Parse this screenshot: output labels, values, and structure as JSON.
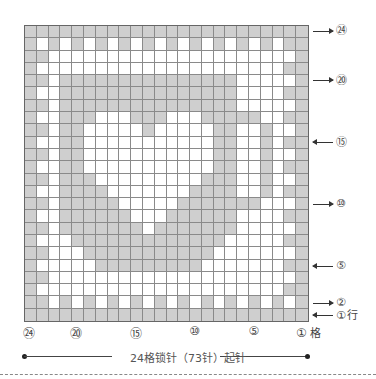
{
  "chart": {
    "columns": 24,
    "rows": 24,
    "legend": {
      "g": "shaded cell",
      "w": "open cell"
    },
    "pattern_top_to_bottom": [
      "GGGGGGGGGGGGGGGGGGGGGGGG",
      "GWGWGWGWGWGWGWGWGWGWGWGG",
      "GGWWWWWWWWWWWWWWWWWWWWWG",
      "GWWWWWWWWWWWWWWWWWWWWWGG",
      "GGWGGGGGGGGGGGGGGGWWWWWG",
      "GWWGGGGGGGGGGGGGGGWWWWGG",
      "GGWGGGGGGGGGGGGGGGWWWWWG",
      "GWWGGGWWWGGGWWWGGGGGWWGG",
      "GGWGGWWWWWGWWWWWGGWWGWWG",
      "GWWGGWWWWWWWWWWWGGWWGWGG",
      "GGWGGWWWWWWWWWWWGGWWGWWG",
      "GWWGGWWWWWWWWWWWGGWWGWGG",
      "GGWGGGWWWWWWWWWGGGWWGWWG",
      "GWWGGGGWWWWWWWGGGGWWGWGG",
      "GGWGGGGGWWWWWGGGGGGGWWWG",
      "GWWGGGGGGWWWGGGGGGWWWWGG",
      "GGWGGGGGGGWGGGGGGGWWWWWG",
      "GWWWGGGGGGGGGGGGGWWWWWGG",
      "GGWWWGGGGGGGGGGGWWWWWWWG",
      "GWWWWWGGGGGGGGGWWWWWWWGG",
      "GGWWWWWWWWWWWWWWWWWWWWWG",
      "GWWWWWWWWWWWWWWWWWWWWWGG",
      "GGWGWGWGWGWGWGWGWGWGWGWG",
      "GGGGGGGGGGGGGGGGGGGGGGGG"
    ]
  },
  "row_labels": [
    {
      "text": "㉔",
      "dir": "right",
      "row": 24
    },
    {
      "text": "⑳",
      "dir": "right",
      "row": 20
    },
    {
      "text": "⑮",
      "dir": "left",
      "row": 15
    },
    {
      "text": "⑩",
      "dir": "right",
      "row": 10
    },
    {
      "text": "⑤",
      "dir": "left",
      "row": 5
    },
    {
      "text": "②",
      "dir": "right",
      "row": 2
    },
    {
      "text": "①",
      "dir": "left",
      "row": 1,
      "suffix": "行"
    }
  ],
  "col_labels": [
    {
      "text": "㉔",
      "col": 24
    },
    {
      "text": "⑳",
      "col": 20
    },
    {
      "text": "⑮",
      "col": 15
    },
    {
      "text": "⑩",
      "col": 10
    },
    {
      "text": "⑤",
      "col": 5
    },
    {
      "text": "①",
      "col": 1,
      "suffix": "格"
    }
  ],
  "base_text": "24格锁针（73针）起针",
  "colors": {
    "shaded": "#cfcfcf",
    "grid_line": "#8a8a8a"
  }
}
